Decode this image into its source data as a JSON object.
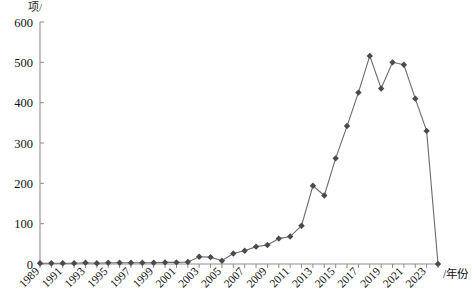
{
  "chart_data": {
    "type": "line",
    "title": "",
    "xlabel": "/年份",
    "ylabel": "项/",
    "ylim": [
      0,
      600
    ],
    "yticks": [
      0,
      100,
      200,
      300,
      400,
      500,
      600
    ],
    "xlim": [
      1989,
      2024
    ],
    "xticks": [
      1989,
      1991,
      1993,
      1995,
      1997,
      1999,
      2001,
      2003,
      2005,
      2007,
      2009,
      2011,
      2013,
      2015,
      2017,
      2019,
      2021,
      2023
    ],
    "grid": false,
    "legend": null,
    "marker": "diamond",
    "series_color": "#5a5a5a",
    "axis_color": "#8d8d8d",
    "x": [
      1989,
      1990,
      1991,
      1992,
      1993,
      1994,
      1995,
      1996,
      1997,
      1998,
      1999,
      2000,
      2001,
      2002,
      2003,
      2004,
      2005,
      2006,
      2007,
      2008,
      2009,
      2010,
      2011,
      2012,
      2013,
      2014,
      2015,
      2016,
      2017,
      2018,
      2019,
      2020,
      2021,
      2022,
      2023,
      2024
    ],
    "values": [
      2,
      2,
      2,
      2,
      3,
      2,
      3,
      3,
      3,
      3,
      3,
      4,
      4,
      5,
      18,
      17,
      8,
      26,
      33,
      43,
      47,
      63,
      68,
      95,
      194,
      170,
      262,
      342,
      425,
      516,
      435,
      500,
      494,
      410,
      330,
      0
    ],
    "series": [
      {
        "name": "项",
        "values": [
          2,
          2,
          2,
          2,
          3,
          2,
          3,
          3,
          3,
          3,
          3,
          4,
          4,
          5,
          18,
          17,
          8,
          26,
          33,
          43,
          47,
          63,
          68,
          95,
          194,
          170,
          262,
          342,
          425,
          516,
          435,
          500,
          494,
          410,
          330,
          0
        ]
      }
    ]
  }
}
